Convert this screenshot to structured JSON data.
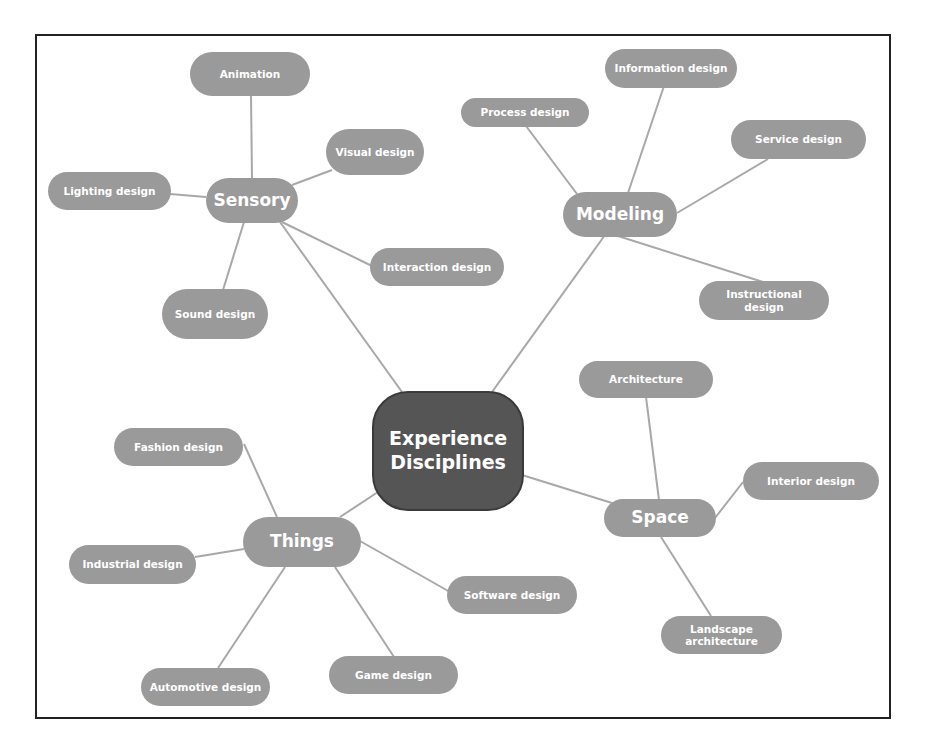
{
  "diagram": {
    "type": "mind-map",
    "colors": {
      "root_fill": "#555555",
      "node_fill": "#9a9a9a",
      "edge": "#a8a8a8",
      "frame": "#222222",
      "text": "#ffffff"
    },
    "root": {
      "label": "Experience Disciplines",
      "line1": "Experience",
      "line2": "Disciplines"
    },
    "branches": {
      "sensory": {
        "label": "Sensory",
        "children": [
          "Animation",
          "Visual design",
          "Lighting design",
          "Interaction design",
          "Sound design"
        ]
      },
      "modeling": {
        "label": "Modeling",
        "children": [
          "Information design",
          "Process design",
          "Service design",
          "Instructional design"
        ]
      },
      "things": {
        "label": "Things",
        "children": [
          "Fashion design",
          "Industrial design",
          "Software design",
          "Automotive design",
          "Game design"
        ]
      },
      "space": {
        "label": "Space",
        "children": [
          "Architecture",
          "Interior design",
          "Landscape architecture"
        ]
      }
    },
    "labels": {
      "instructional_l1": "Instructional",
      "instructional_l2": "design",
      "landscape_l1": "Landscape",
      "landscape_l2": "architecture"
    }
  }
}
